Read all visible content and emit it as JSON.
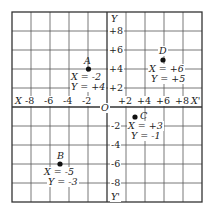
{
  "diagram": {
    "type": "coordinate-grid",
    "grid": {
      "min": -10,
      "max": 10,
      "step": 2
    },
    "axes": {
      "x_neg_label": "X",
      "x_pos_label": "X'",
      "y_pos_label": "Y",
      "y_neg_label": "Y'",
      "origin_label": "O",
      "x_ticks": [
        "-8",
        "-6",
        "-4",
        "-2",
        "+2",
        "+4",
        "+6",
        "+8"
      ],
      "y_ticks_pos": [
        "+8",
        "+6",
        "+4",
        "+2"
      ],
      "y_ticks_neg": [
        "-2",
        "-4",
        "-6",
        "-8"
      ]
    },
    "points": [
      {
        "name": "A",
        "x_text": "X = -2",
        "y_text": "Y = +4",
        "x": -2,
        "y": 4
      },
      {
        "name": "B",
        "x_text": "X = -5",
        "y_text": "Y = -3",
        "x": -5,
        "y": -3
      },
      {
        "name": "C",
        "x_text": "X = +3",
        "y_text": "Y = -1",
        "x": 3,
        "y": -1
      },
      {
        "name": "D",
        "x_text": "X = +6",
        "y_text": "Y = +5",
        "x": 6,
        "y": 5
      }
    ]
  }
}
